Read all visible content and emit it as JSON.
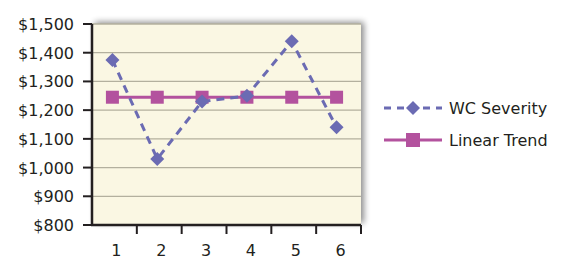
{
  "chart_data": {
    "type": "line",
    "title": "",
    "xlabel": "",
    "ylabel": "",
    "categories": [
      "1",
      "2",
      "3",
      "4",
      "5",
      "6"
    ],
    "series": [
      {
        "name": "WC Severity",
        "values": [
          1375,
          1030,
          1230,
          1250,
          1440,
          1140
        ],
        "color": "#6b6bb3",
        "line_style": "dashed",
        "marker": "diamond"
      },
      {
        "name": "Linear Trend",
        "values": [
          1245,
          1245,
          1245,
          1245,
          1245,
          1245
        ],
        "color": "#b3529e",
        "line_style": "solid",
        "marker": "square"
      }
    ],
    "ylim": [
      800,
      1500
    ],
    "y_ticks": [
      800,
      900,
      1000,
      1100,
      1200,
      1300,
      1400,
      1500
    ],
    "y_tick_labels": [
      "$800",
      "$900",
      "$1,000",
      "$1,100",
      "$1,200",
      "$1,300",
      "$1,400",
      "$1,500"
    ],
    "grid": true,
    "legend_position": "right",
    "plot_background": "#faf7e3",
    "grid_color": "#b3b09e"
  },
  "legend": {
    "items": [
      {
        "label": "WC Severity"
      },
      {
        "label": "Linear Trend"
      }
    ]
  }
}
